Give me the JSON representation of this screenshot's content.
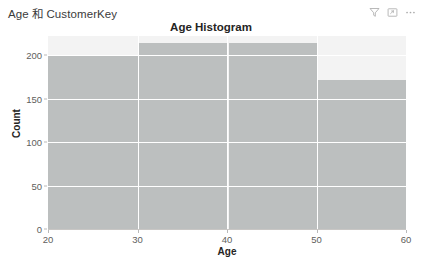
{
  "header": {
    "subtitle": "Age 和 CustomerKey",
    "actions": [
      {
        "name": "filter-icon",
        "label": "Filter"
      },
      {
        "name": "focus-mode-icon",
        "label": "Focus mode"
      },
      {
        "name": "more-options-icon",
        "label": "More options"
      }
    ]
  },
  "chart_data": {
    "type": "bar",
    "title": "Age Histogram",
    "subtitle": "Age 和 CustomerKey",
    "xlabel": "Age",
    "ylabel": "Count",
    "categories": [
      "20–30",
      "30–40",
      "40–50",
      "50–60"
    ],
    "bin_edges": [
      20,
      30,
      40,
      50,
      60
    ],
    "values": [
      199,
      214,
      214,
      171
    ],
    "xlim": [
      20,
      60
    ],
    "ylim": [
      0,
      222
    ],
    "xticks": [
      20,
      30,
      40,
      50,
      60
    ],
    "yticks": [
      0,
      50,
      100,
      150,
      200
    ],
    "xtick_labels": [
      "20",
      "30",
      "40",
      "50",
      "60"
    ],
    "ytick_labels": [
      "0",
      "50",
      "100",
      "150",
      "200"
    ],
    "grid": "horizontal-and-vertical-white",
    "legend": "none",
    "bar_color": "#bcbfbf",
    "plot_background": "#f3f3f3",
    "gridline_color": "#ffffff",
    "text_color": "#252423",
    "tick_color": "#605e5c"
  }
}
